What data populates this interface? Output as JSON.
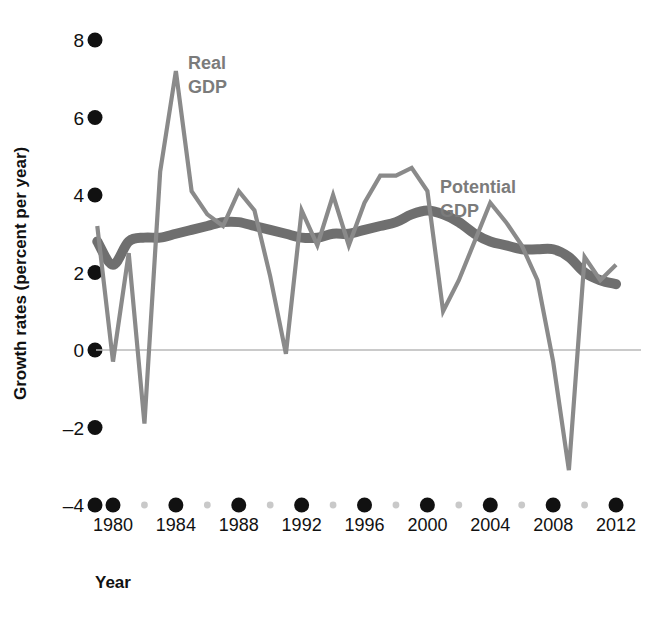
{
  "chart_data": {
    "type": "line",
    "title": "",
    "xlabel": "Year",
    "ylabel": "Growth rates (percent per year)",
    "xlim": [
      1979,
      2013
    ],
    "ylim": [
      -4,
      8
    ],
    "grid": false,
    "legend_position": "inline-annotations",
    "x_ticks_major": [
      1980,
      1984,
      1988,
      1992,
      1996,
      2000,
      2004,
      2008,
      2012
    ],
    "x_ticks_minor": [
      1982,
      1986,
      1990,
      1994,
      1998,
      2002,
      2006,
      2010
    ],
    "y_ticks": [
      8,
      6,
      4,
      2,
      0,
      -2,
      -4
    ],
    "y_tick_labels": [
      "8",
      "6",
      "4",
      "2",
      "0",
      "–2",
      "–4"
    ],
    "zero_line": 0,
    "x": [
      1979,
      1980,
      1981,
      1982,
      1983,
      1984,
      1985,
      1986,
      1987,
      1988,
      1989,
      1990,
      1991,
      1992,
      1993,
      1994,
      1995,
      1996,
      1997,
      1998,
      1999,
      2000,
      2001,
      2002,
      2003,
      2004,
      2005,
      2006,
      2007,
      2008,
      2009,
      2010,
      2011,
      2012
    ],
    "series": [
      {
        "name": "Real GDP",
        "color": "#8a8a8a",
        "label": "Real\nGDP",
        "label_line1": "Real",
        "label_line2": "GDP",
        "values": [
          3.2,
          -0.3,
          2.5,
          -1.9,
          4.6,
          7.2,
          4.1,
          3.5,
          3.2,
          4.1,
          3.6,
          1.9,
          -0.1,
          3.6,
          2.7,
          4.0,
          2.7,
          3.8,
          4.5,
          4.5,
          4.7,
          4.1,
          1.0,
          1.8,
          2.8,
          3.8,
          3.3,
          2.7,
          1.8,
          -0.3,
          -3.1,
          2.4,
          1.8,
          2.2
        ]
      },
      {
        "name": "Potential GDP",
        "color": "#6f6f6f",
        "label": "Potential\nGDP",
        "label_line1": "Potential",
        "label_line2": "GDP",
        "values": [
          2.8,
          2.2,
          2.8,
          2.9,
          2.9,
          3.0,
          3.1,
          3.2,
          3.3,
          3.3,
          3.2,
          3.1,
          3.0,
          2.9,
          2.9,
          3.0,
          3.0,
          3.1,
          3.2,
          3.3,
          3.5,
          3.6,
          3.5,
          3.3,
          3.0,
          2.8,
          2.7,
          2.6,
          2.6,
          2.6,
          2.4,
          2.0,
          1.8,
          1.7
        ]
      }
    ],
    "annotations": [
      {
        "text": "Real GDP",
        "x": 1985.5,
        "y": 6.6
      },
      {
        "text": "Potential GDP",
        "x": 2001.5,
        "y": 4.6
      }
    ]
  },
  "axes": {
    "y_title": "Growth rates (percent per year)",
    "x_title": "Year"
  },
  "colors": {
    "real_gdp": "#8a8a8a",
    "potential_gdp": "#6f6f6f",
    "tick_major": "#111111",
    "tick_minor": "#c9c9c9",
    "zero_line": "#b9b9b9",
    "label_text": "#7b7b7b",
    "background": "#ffffff"
  }
}
